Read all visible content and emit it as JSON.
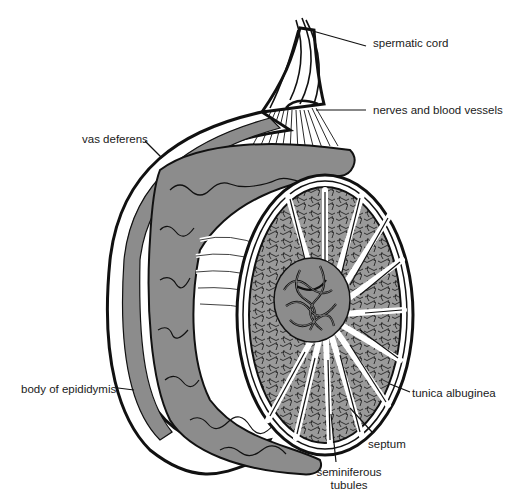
{
  "diagram": {
    "colors": {
      "outline": "#111111",
      "tissue_fill": "#8c8c8c",
      "lobule_fill": "#9a9a9a",
      "background": "#ffffff"
    },
    "labels": [
      {
        "id": "spermatic-cord",
        "text": "spermatic cord"
      },
      {
        "id": "nerves-and-blood-vessels",
        "text": "nerves and blood vessels"
      },
      {
        "id": "vas-deferens",
        "text": "vas deferens"
      },
      {
        "id": "body-of-epididymis",
        "text": "body of epididymis"
      },
      {
        "id": "tunica-albuginea",
        "text": "tunica albuginea"
      },
      {
        "id": "septum",
        "text": "septum"
      },
      {
        "id": "seminiferous-tubules-line1",
        "text": "seminiferous"
      },
      {
        "id": "seminiferous-tubules-line2",
        "text": "tubules"
      }
    ]
  }
}
